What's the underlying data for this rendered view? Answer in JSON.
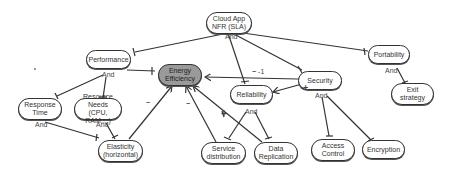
{
  "diagram": {
    "type": "softgoal-interdependency-graph",
    "nodes": {
      "root": "Cloud App NFR (SLA)",
      "root_l1": "Cloud App",
      "root_l2": "NFR (SLA)",
      "performance": "Performance",
      "portability": "Portability",
      "energy_l1": "Energy",
      "energy_l2": "Efficiency",
      "security": "Security",
      "reliability": "Reliability",
      "response_l1": "Response",
      "response_l2": "Time",
      "resource_l1": "Resource Needs",
      "resource_l2": "(CPU, RAM,...)",
      "elasticity_l1": "Elasticity",
      "elasticity_l2": "(horizontal)",
      "service_l1": "Service",
      "service_l2": "distribution",
      "data_l1": "Data",
      "data_l2": "Replication",
      "access_l1": "Access",
      "access_l2": "Control",
      "encryption": "Encryption",
      "exit_l1": "Exit",
      "exit_l2": "strategy"
    },
    "decompositions": {
      "root_and": "And",
      "performance_and": "And",
      "portability_and": "And",
      "response_and": "And",
      "resource_and": "And",
      "reliability_and": "And",
      "security_and": "And"
    },
    "contributions": {
      "security_to_energy": "-1",
      "security_to_energy_sign": "−",
      "elasticity_to_energy": "−",
      "service_to_energy": "−",
      "data_to_energy": "+",
      "security_to_reliability": "+"
    },
    "colors": {
      "main_goal_fill": "#9a9a9a",
      "node_fill": "#ffffff",
      "stroke": "#333333"
    }
  }
}
